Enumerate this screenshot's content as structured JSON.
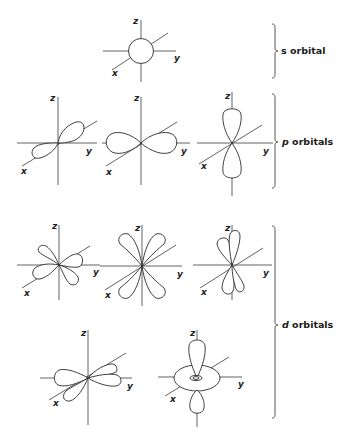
{
  "figure": {
    "groups": [
      {
        "id": "s",
        "symbol": "s",
        "text": " orbital",
        "count": 1
      },
      {
        "id": "p",
        "symbol": "p",
        "text": " orbitals",
        "count": 3
      },
      {
        "id": "d",
        "symbol": "d",
        "text": " orbitals",
        "count": 5
      }
    ],
    "axis_labels": {
      "x": "x",
      "y": "y",
      "z": "z"
    },
    "colors": {
      "line": "#2a2a2a",
      "background": "#ffffff"
    }
  }
}
